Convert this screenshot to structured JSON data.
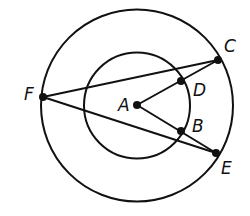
{
  "diagram": {
    "title": "",
    "stroke_color": "#111111",
    "background": "#ffffff",
    "circles": [
      {
        "name": "outer-circle",
        "cx": 137,
        "cy": 105.5,
        "r": 96
      },
      {
        "name": "inner-circle",
        "cx": 137,
        "cy": 105.5,
        "r": 53
      }
    ],
    "points": {
      "A": {
        "x": 137,
        "y": 105,
        "label": "A",
        "lx": 118,
        "ly": 111
      },
      "B": {
        "x": 181,
        "y": 131,
        "label": "B",
        "lx": 192,
        "ly": 132
      },
      "C": {
        "x": 218,
        "y": 60,
        "label": "C",
        "lx": 224,
        "ly": 52
      },
      "D": {
        "x": 181,
        "y": 81,
        "label": "D",
        "lx": 193,
        "ly": 96
      },
      "E": {
        "x": 216,
        "y": 153,
        "label": "E",
        "lx": 221,
        "ly": 174
      },
      "F": {
        "x": 43,
        "y": 97,
        "label": "F",
        "lx": 24,
        "ly": 100
      }
    },
    "segments": [
      [
        "F",
        "C"
      ],
      [
        "F",
        "E"
      ],
      [
        "A",
        "C"
      ],
      [
        "A",
        "E"
      ]
    ]
  }
}
